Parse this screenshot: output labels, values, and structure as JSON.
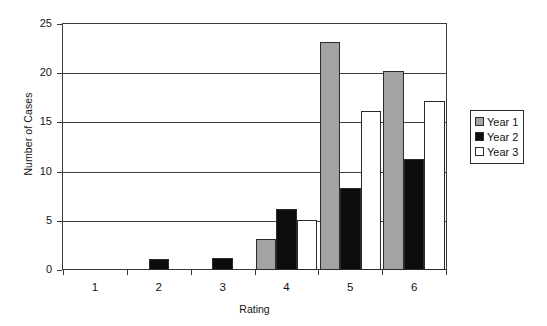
{
  "chart_data": {
    "type": "bar",
    "title": "",
    "xlabel": "Rating",
    "ylabel": "Number of Cases",
    "categories": [
      "1",
      "2",
      "3",
      "4",
      "5",
      "6"
    ],
    "series": [
      {
        "name": "Year 1",
        "color": "#a3a3a3",
        "values": [
          0,
          0,
          0,
          3.2,
          23.2,
          20.2
        ]
      },
      {
        "name": "Year 2",
        "color": "#0d0d0d",
        "values": [
          0,
          1.1,
          1.2,
          6.2,
          8.3,
          11.3
        ]
      },
      {
        "name": "Year 3",
        "color": "#ffffff",
        "values": [
          0,
          0,
          0,
          5.1,
          16.2,
          17.2
        ]
      }
    ],
    "ylim": [
      0,
      25
    ],
    "yticks": [
      0,
      5,
      10,
      15,
      20,
      25
    ],
    "ytick_labels": [
      "0",
      "5",
      "10",
      "15",
      "20",
      "25"
    ],
    "grid": "horizontal",
    "legend_position": "right",
    "legend_entries": [
      "Year 1",
      "Year 2",
      "Year 3"
    ],
    "bar_mode": "grouped"
  },
  "axes": {
    "y_title": "Number of Cases",
    "x_title": "Rating"
  }
}
